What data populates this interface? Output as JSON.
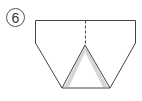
{
  "step": {
    "number": "6"
  },
  "diagram": {
    "stroke_color": "#444444",
    "shading_color": "#bbbbbb"
  }
}
